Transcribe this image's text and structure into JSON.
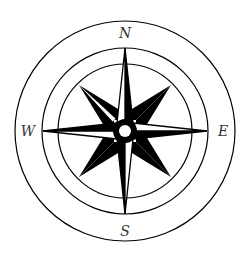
{
  "compass": {
    "labels": {
      "north": "N",
      "east": "E",
      "south": "S",
      "west": "W"
    },
    "colors": {
      "ink": "#000000",
      "paper": "#ffffff",
      "label": "#333333"
    }
  }
}
